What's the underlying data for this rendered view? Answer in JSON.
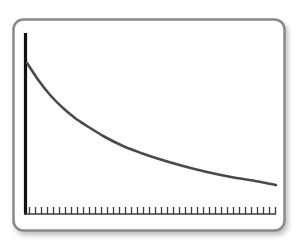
{
  "figure": {
    "title": "",
    "background_color": "#ffffff",
    "frame": {
      "name": "rounded-panel",
      "x": 13.5,
      "y": 19.5,
      "width": 271,
      "height": 211,
      "corner_radius": 10,
      "border_color": "#8a8a8a",
      "border_width": 2.5,
      "fill_color": "#ffffff",
      "shadow_color": "#c9c9c9"
    },
    "axes": {
      "y_axis": {
        "name": "y-axis",
        "x": 25.5,
        "y_top": 33,
        "y_bottom": 214,
        "color": "#111111",
        "width": 3.2,
        "label": ""
      },
      "x_axis": {
        "name": "x-axis",
        "y": 214,
        "x_start": 25.5,
        "x_end": 276,
        "color": "#3a3a3a",
        "width": 1.4,
        "label": "",
        "tick_count": 42,
        "tick_length": 7,
        "tick_color": "#3a3a3a",
        "tick_width": 1.3,
        "tick_spacing": 6
      }
    }
  },
  "chart_data": {
    "type": "line",
    "title": "",
    "xlabel": "",
    "ylabel": "",
    "grid": false,
    "legend": null,
    "xlim": [
      0,
      42
    ],
    "ylim": [
      0,
      1
    ],
    "series": [
      {
        "name": "exponential-decay-curve",
        "color": "#4a4a4a",
        "line_width": 2.6,
        "x": [
          0,
          2,
          4,
          6,
          8,
          10,
          13,
          16,
          19,
          22,
          26,
          30,
          34,
          38,
          42
        ],
        "y": [
          0.835,
          0.735,
          0.655,
          0.59,
          0.535,
          0.49,
          0.432,
          0.384,
          0.345,
          0.312,
          0.275,
          0.244,
          0.218,
          0.196,
          0.178
        ],
        "pixel_points": [
          [
            27,
            63
          ],
          [
            39,
            81
          ],
          [
            51,
            96
          ],
          [
            63,
            108
          ],
          [
            75,
            118
          ],
          [
            87,
            126
          ],
          [
            105,
            137
          ],
          [
            123,
            146
          ],
          [
            141,
            153
          ],
          [
            159,
            159
          ],
          [
            183,
            166
          ],
          [
            207,
            172
          ],
          [
            231,
            177
          ],
          [
            255,
            181
          ],
          [
            276,
            185
          ]
        ]
      }
    ]
  }
}
